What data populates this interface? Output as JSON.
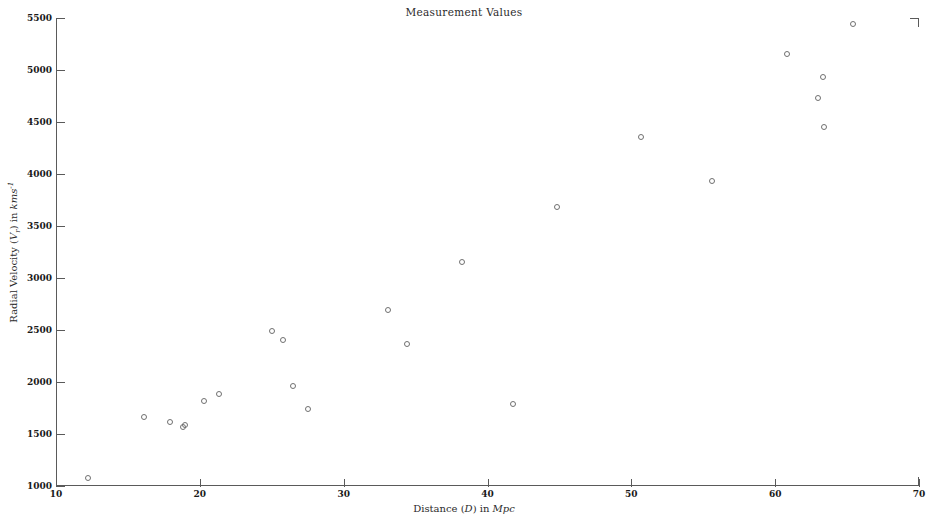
{
  "chart_data": {
    "type": "scatter",
    "title": "Measurement Values",
    "xlabel": "Distance (D) in Mpc",
    "ylabel": "Radial Velocity (Vr) in kms-1",
    "xlabel_parts": {
      "lead": "Distance (",
      "var": "D",
      "mid": ") in ",
      "unit": "Mpc"
    },
    "ylabel_parts": {
      "lead": "Radial Velocity (",
      "var": "V",
      "var_sub": "r",
      "mid": ") in ",
      "unit": "kms",
      "unit_sup": "-1"
    },
    "xlim": [
      10,
      70
    ],
    "ylim": [
      1000,
      5500
    ],
    "xticks": [
      10,
      20,
      30,
      40,
      50,
      60,
      70
    ],
    "yticks": [
      1000,
      1500,
      2000,
      2500,
      3000,
      3500,
      4000,
      4500,
      5000,
      5500
    ],
    "grid": false,
    "legend": null,
    "marker": "open-circle",
    "marker_color": "#707070",
    "x": [
      12.2,
      16.1,
      17.9,
      18.8,
      19.0,
      20.3,
      21.3,
      25.0,
      25.8,
      26.5,
      27.5,
      33.1,
      34.4,
      38.2,
      41.8,
      44.8,
      50.7,
      55.6,
      60.8,
      63.0,
      63.3,
      63.4,
      65.4
    ],
    "y": [
      1077,
      1663,
      1615,
      1567,
      1586,
      1817,
      1884,
      2490,
      2404,
      1962,
      1740,
      2692,
      2365,
      3154,
      1788,
      3683,
      4356,
      3933,
      5154,
      4731,
      4933,
      4452,
      5443
    ],
    "points": [
      {
        "x": 12.2,
        "y": 1077
      },
      {
        "x": 16.1,
        "y": 1663
      },
      {
        "x": 17.9,
        "y": 1615
      },
      {
        "x": 18.8,
        "y": 1567
      },
      {
        "x": 19.0,
        "y": 1586
      },
      {
        "x": 20.3,
        "y": 1817
      },
      {
        "x": 21.3,
        "y": 1884
      },
      {
        "x": 25.0,
        "y": 2490
      },
      {
        "x": 25.8,
        "y": 2404
      },
      {
        "x": 26.5,
        "y": 1962
      },
      {
        "x": 27.5,
        "y": 1740
      },
      {
        "x": 33.1,
        "y": 2692
      },
      {
        "x": 34.4,
        "y": 2365
      },
      {
        "x": 38.2,
        "y": 3154
      },
      {
        "x": 41.8,
        "y": 1788
      },
      {
        "x": 44.8,
        "y": 3683
      },
      {
        "x": 50.7,
        "y": 4356
      },
      {
        "x": 55.6,
        "y": 3933
      },
      {
        "x": 60.8,
        "y": 5154
      },
      {
        "x": 63.0,
        "y": 4731
      },
      {
        "x": 63.3,
        "y": 4933
      },
      {
        "x": 63.4,
        "y": 4452
      },
      {
        "x": 65.4,
        "y": 5443
      }
    ]
  }
}
